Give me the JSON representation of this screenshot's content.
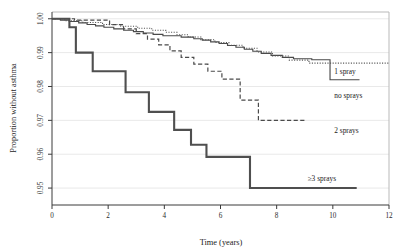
{
  "chart_data": {
    "type": "line",
    "title": "",
    "xlabel": "Time (years)",
    "ylabel": "Proportion without asthma",
    "xlim": [
      0,
      12
    ],
    "ylim": [
      0.945,
      1.002
    ],
    "xticks": [
      "0",
      "2",
      "4",
      "6",
      "8",
      "10",
      "12"
    ],
    "xtick_values": [
      0,
      2,
      4,
      6,
      8,
      10,
      12
    ],
    "yticks": [
      "0.95",
      "0.96",
      "0.97",
      "0.98",
      "0.99",
      "1.00"
    ],
    "ytick_values": [
      0.95,
      0.96,
      0.97,
      0.98,
      0.99,
      1.0
    ],
    "grid": true,
    "legend_position": "inline-right-of-curve-ends",
    "series": [
      {
        "name": "no sprays",
        "label": "no sprays",
        "style": "solid-thin",
        "label_x": 10.05,
        "label_y": 0.9765,
        "points": [
          [
            0.0,
            1.0
          ],
          [
            0.3,
            1.0
          ],
          [
            0.3,
            0.9996
          ],
          [
            0.62,
            0.9996
          ],
          [
            0.62,
            0.9992
          ],
          [
            0.95,
            0.9992
          ],
          [
            0.95,
            0.9988
          ],
          [
            1.25,
            0.9988
          ],
          [
            1.25,
            0.9983
          ],
          [
            1.55,
            0.9983
          ],
          [
            1.55,
            0.9979
          ],
          [
            1.85,
            0.9979
          ],
          [
            1.85,
            0.9975
          ],
          [
            2.2,
            0.9975
          ],
          [
            2.2,
            0.997
          ],
          [
            2.55,
            0.997
          ],
          [
            2.55,
            0.9966
          ],
          [
            2.9,
            0.9966
          ],
          [
            2.9,
            0.9962
          ],
          [
            3.25,
            0.9962
          ],
          [
            3.25,
            0.9958
          ],
          [
            3.6,
            0.9958
          ],
          [
            3.6,
            0.9954
          ],
          [
            3.95,
            0.9954
          ],
          [
            3.95,
            0.995
          ],
          [
            4.6,
            0.995
          ],
          [
            4.6,
            0.9946
          ],
          [
            5.05,
            0.9946
          ],
          [
            5.05,
            0.9941
          ],
          [
            5.35,
            0.9941
          ],
          [
            5.35,
            0.9937
          ],
          [
            5.65,
            0.9937
          ],
          [
            5.65,
            0.9932
          ],
          [
            5.95,
            0.9932
          ],
          [
            5.95,
            0.9927
          ],
          [
            6.25,
            0.9927
          ],
          [
            6.25,
            0.9921
          ],
          [
            6.55,
            0.9921
          ],
          [
            6.55,
            0.9916
          ],
          [
            6.85,
            0.9916
          ],
          [
            6.85,
            0.991
          ],
          [
            7.15,
            0.991
          ],
          [
            7.15,
            0.9904
          ],
          [
            7.45,
            0.9904
          ],
          [
            7.45,
            0.9898
          ],
          [
            7.8,
            0.9898
          ],
          [
            7.8,
            0.9892
          ],
          [
            8.2,
            0.9892
          ],
          [
            8.2,
            0.9886
          ],
          [
            8.6,
            0.9886
          ],
          [
            8.6,
            0.9882
          ],
          [
            9.25,
            0.9882
          ],
          [
            9.25,
            0.9879
          ],
          [
            9.9,
            0.9879
          ],
          [
            9.9,
            0.982
          ],
          [
            10.95,
            0.982
          ]
        ]
      },
      {
        "name": "1 spray",
        "label": "1 spray",
        "style": "dotted",
        "label_x": 10.05,
        "label_y": 0.9838,
        "points": [
          [
            0.0,
            1.0
          ],
          [
            0.45,
            1.0
          ],
          [
            0.45,
            0.9994
          ],
          [
            1.1,
            0.9994
          ],
          [
            1.1,
            0.9989
          ],
          [
            1.8,
            0.9989
          ],
          [
            1.8,
            0.9983
          ],
          [
            2.45,
            0.9983
          ],
          [
            2.45,
            0.9978
          ],
          [
            3.05,
            0.9978
          ],
          [
            3.05,
            0.9972
          ],
          [
            3.55,
            0.9972
          ],
          [
            3.55,
            0.9966
          ],
          [
            4.05,
            0.9966
          ],
          [
            4.05,
            0.996
          ],
          [
            4.45,
            0.996
          ],
          [
            4.45,
            0.9953
          ],
          [
            4.85,
            0.9953
          ],
          [
            4.85,
            0.9946
          ],
          [
            5.3,
            0.9946
          ],
          [
            5.3,
            0.9938
          ],
          [
            5.8,
            0.9938
          ],
          [
            5.8,
            0.993
          ],
          [
            6.3,
            0.993
          ],
          [
            6.3,
            0.9922
          ],
          [
            6.8,
            0.9922
          ],
          [
            6.8,
            0.9913
          ],
          [
            7.3,
            0.9913
          ],
          [
            7.3,
            0.9902
          ],
          [
            7.85,
            0.9902
          ],
          [
            7.85,
            0.989
          ],
          [
            8.45,
            0.989
          ],
          [
            8.45,
            0.9878
          ],
          [
            9.15,
            0.9878
          ],
          [
            9.15,
            0.9869
          ],
          [
            12.0,
            0.9869
          ]
        ]
      },
      {
        "name": "2 sprays",
        "label": "2 sprays",
        "style": "dashed",
        "label_x": 10.05,
        "label_y": 0.9662,
        "points": [
          [
            0.0,
            1.0
          ],
          [
            0.8,
            1.0
          ],
          [
            0.8,
            0.9996
          ],
          [
            2.05,
            0.9996
          ],
          [
            2.05,
            0.9983
          ],
          [
            2.55,
            0.9983
          ],
          [
            2.55,
            0.997
          ],
          [
            3.0,
            0.997
          ],
          [
            3.0,
            0.9956
          ],
          [
            3.4,
            0.9956
          ],
          [
            3.4,
            0.994
          ],
          [
            3.8,
            0.994
          ],
          [
            3.8,
            0.9923
          ],
          [
            4.2,
            0.9923
          ],
          [
            4.2,
            0.9905
          ],
          [
            4.6,
            0.9905
          ],
          [
            4.6,
            0.9886
          ],
          [
            5.05,
            0.9886
          ],
          [
            5.05,
            0.9866
          ],
          [
            5.55,
            0.9866
          ],
          [
            5.55,
            0.9845
          ],
          [
            6.05,
            0.9845
          ],
          [
            6.05,
            0.9822
          ],
          [
            6.7,
            0.9822
          ],
          [
            6.7,
            0.976
          ],
          [
            7.35,
            0.976
          ],
          [
            7.35,
            0.97
          ],
          [
            9.05,
            0.97
          ]
        ]
      },
      {
        "name": "3 or more sprays",
        "label": "≥3 sprays",
        "style": "thick",
        "label_x": 9.1,
        "label_y": 0.9522,
        "points": [
          [
            0.0,
            1.0
          ],
          [
            0.62,
            1.0
          ],
          [
            0.62,
            0.9975
          ],
          [
            0.85,
            0.9975
          ],
          [
            0.85,
            0.99
          ],
          [
            1.45,
            0.99
          ],
          [
            1.45,
            0.9845
          ],
          [
            2.62,
            0.9845
          ],
          [
            2.62,
            0.9783
          ],
          [
            3.45,
            0.9783
          ],
          [
            3.45,
            0.9725
          ],
          [
            4.35,
            0.9725
          ],
          [
            4.35,
            0.9672
          ],
          [
            4.95,
            0.9672
          ],
          [
            4.95,
            0.9628
          ],
          [
            5.5,
            0.9628
          ],
          [
            5.5,
            0.9592
          ],
          [
            7.05,
            0.9592
          ],
          [
            7.05,
            0.95
          ],
          [
            10.85,
            0.95
          ]
        ]
      }
    ]
  }
}
